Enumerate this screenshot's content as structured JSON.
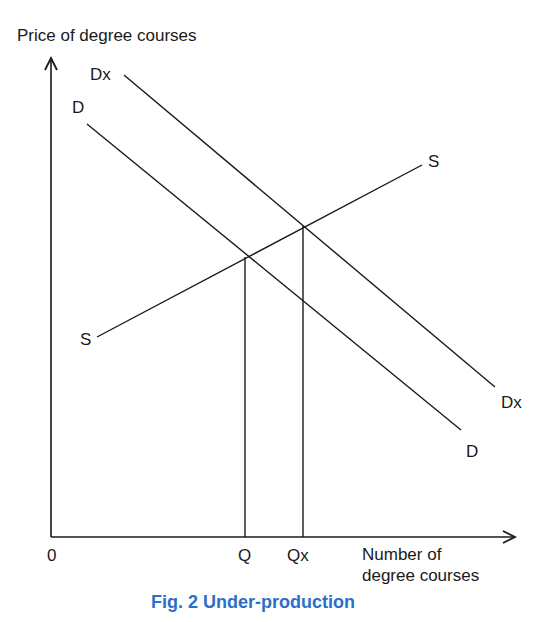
{
  "figure": {
    "caption": "Fig. 2 Under-production",
    "y_axis_label": "Price of degree courses",
    "x_axis_label_line1": "Number of",
    "x_axis_label_line2": "degree courses",
    "origin_label": "0",
    "colors": {
      "lines": "#1a1a1a",
      "caption": "#2a6fc9"
    }
  },
  "curves": {
    "demand_private": {
      "label_start": "D",
      "label_end": "D"
    },
    "demand_social": {
      "label_start": "Dx",
      "label_end": "Dx"
    },
    "supply": {
      "label_start": "S",
      "label_end": "S"
    }
  },
  "quantities": {
    "market": "Q",
    "social_optimum": "Qx"
  }
}
